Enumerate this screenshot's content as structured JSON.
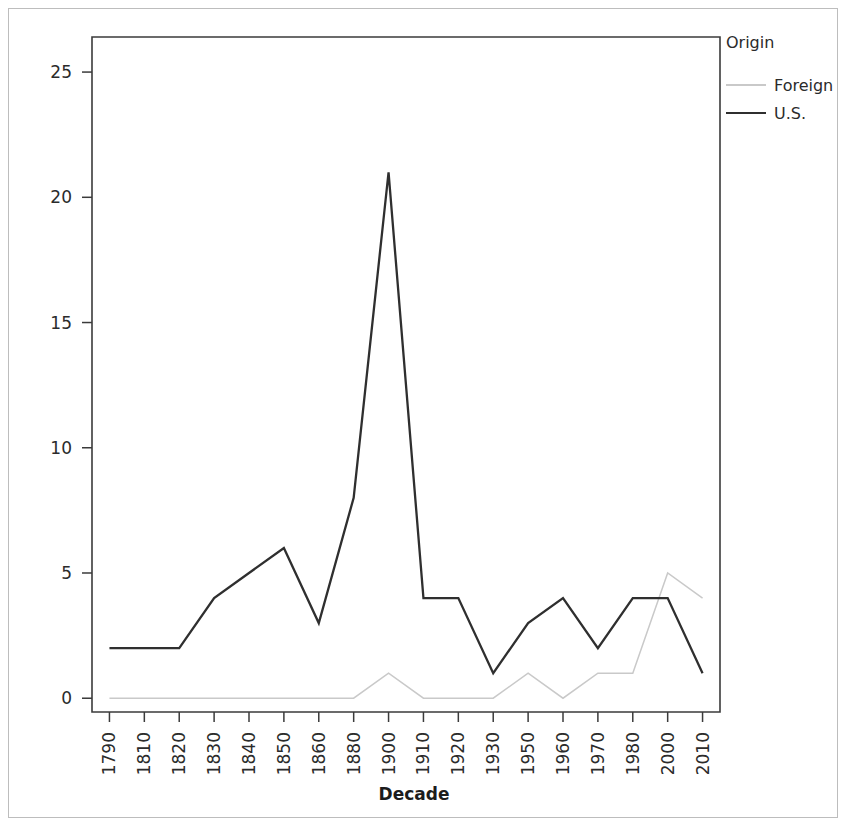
{
  "chart_data": {
    "type": "line",
    "title": "",
    "xlabel": "Decade",
    "ylabel": "",
    "categories": [
      "1790",
      "1810",
      "1820",
      "1830",
      "1840",
      "1850",
      "1860",
      "1880",
      "1900",
      "1910",
      "1920",
      "1930",
      "1950",
      "1960",
      "1970",
      "1980",
      "2000",
      "2010"
    ],
    "series": [
      {
        "name": "Foreign",
        "color": "#c9c9c9",
        "values": [
          0,
          0,
          0,
          0,
          0,
          0,
          0,
          0,
          1,
          0,
          0,
          0,
          1,
          0,
          1,
          1,
          5,
          4
        ]
      },
      {
        "name": "U.S.",
        "color": "#2f2f2f",
        "values": [
          2,
          2,
          2,
          4,
          5,
          6,
          3,
          8,
          21,
          4,
          4,
          1,
          3,
          4,
          2,
          4,
          4,
          1
        ]
      }
    ],
    "yticks": [
      0,
      5,
      10,
      15,
      20,
      25
    ],
    "ytick_labels": [
      "0",
      "5",
      "10",
      "15",
      "20",
      "25"
    ],
    "ylim": [
      -0.55,
      26.4
    ],
    "grid": false,
    "legend": {
      "title": "Origin",
      "position": "right",
      "entries": [
        {
          "label": "Foreign",
          "color": "#c9c9c9",
          "style": "solid-thin"
        },
        {
          "label": "U.S.",
          "color": "#2f2f2f",
          "style": "solid"
        }
      ]
    }
  },
  "axis": {
    "x_title": "Decade",
    "tick_labels_x": [
      "1790",
      "1810",
      "1820",
      "1830",
      "1840",
      "1850",
      "1860",
      "1880",
      "1900",
      "1910",
      "1920",
      "1930",
      "1950",
      "1960",
      "1970",
      "1980",
      "2000",
      "2010"
    ],
    "tick_labels_y": [
      "25",
      "20",
      "15",
      "10",
      "5",
      "0"
    ]
  },
  "legend": {
    "title": "Origin",
    "item_foreign": "Foreign",
    "item_us": "U.S."
  },
  "colors": {
    "foreign": "#c9c9c9",
    "us": "#2f2f2f",
    "axis": "#3b3b3b",
    "page_border": "#bdbdbd",
    "background": "#ffffff"
  }
}
